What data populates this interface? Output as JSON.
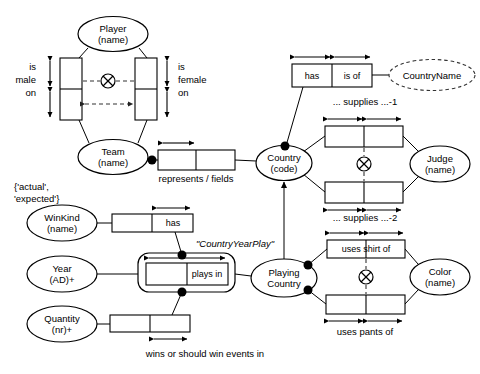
{
  "diagram": {
    "type": "orm-fact-diagram",
    "stroke_color": "#000000",
    "fill_color": "#ffffff",
    "dashed_color": "#555555"
  },
  "entities": [
    {
      "id": "player",
      "name": "Player",
      "ref": "(name)",
      "cx": 113,
      "cy": 34,
      "rx": 35,
      "ry": 17.5,
      "style": "solid"
    },
    {
      "id": "team",
      "name": "Team",
      "ref": "(name)",
      "cx": 113,
      "cy": 157,
      "rx": 35,
      "ry": 17.5,
      "style": "solid"
    },
    {
      "id": "countryname",
      "name": "CountryName",
      "ref": "",
      "cx": 432,
      "cy": 75,
      "rx": 43,
      "ry": 15.5,
      "style": "dashed"
    },
    {
      "id": "country",
      "name": "Country",
      "ref": "(code)",
      "cx": 284,
      "cy": 163,
      "rx": 28,
      "ry": 17.5,
      "style": "solid"
    },
    {
      "id": "judge",
      "name": "Judge",
      "ref": "(name)",
      "cx": 440,
      "cy": 164,
      "rx": 30,
      "ry": 18,
      "style": "solid"
    },
    {
      "id": "winkind",
      "name": "WinKind",
      "ref": "(name)",
      "cx": 62,
      "cy": 223,
      "rx": 35,
      "ry": 18,
      "style": "solid"
    },
    {
      "id": "year",
      "name": "Year",
      "ref": "(AD)+",
      "cx": 62,
      "cy": 274,
      "rx": 35,
      "ry": 18,
      "style": "solid"
    },
    {
      "id": "quantity",
      "name": "Quantity",
      "ref": "(nr)+",
      "cx": 62,
      "cy": 324,
      "rx": 35,
      "ry": 18,
      "style": "solid"
    },
    {
      "id": "playingcountry",
      "name": "Playing",
      "ref": "Country",
      "cx": 284,
      "cy": 278,
      "rx": 33,
      "ry": 19,
      "style": "solid"
    },
    {
      "id": "color",
      "name": "Color",
      "ref": "(name)",
      "cx": 440,
      "cy": 277,
      "rx": 30,
      "ry": 18,
      "style": "solid"
    }
  ],
  "fact_types": [
    {
      "id": "is-male-on",
      "orientation": "vertical",
      "x": 60,
      "y": 58,
      "w": 22,
      "h": 62,
      "cells": 2,
      "text": ""
    },
    {
      "id": "is-female-on",
      "orientation": "vertical",
      "x": 135,
      "y": 58,
      "w": 22,
      "h": 62,
      "cells": 2,
      "text": ""
    },
    {
      "id": "represents-fields",
      "orientation": "horizontal",
      "x": 158,
      "y": 150,
      "w": 77,
      "h": 20,
      "cells": 2,
      "text": ""
    },
    {
      "id": "has-is-of",
      "orientation": "horizontal",
      "x": 292,
      "y": 64,
      "w": 80,
      "h": 23,
      "cells": 2,
      "text": "has|is of"
    },
    {
      "id": "supplies-1",
      "orientation": "horizontal",
      "x": 325,
      "y": 126,
      "w": 78,
      "h": 21,
      "cells": 2,
      "text": ""
    },
    {
      "id": "supplies-2",
      "orientation": "horizontal",
      "x": 325,
      "y": 182,
      "w": 78,
      "h": 21,
      "cells": 2,
      "text": ""
    },
    {
      "id": "winkind-has",
      "orientation": "horizontal",
      "x": 112,
      "y": 214,
      "w": 81,
      "h": 18,
      "cells": 2,
      "text": "|has"
    },
    {
      "id": "plays-in-inner",
      "orientation": "horizontal",
      "x": 146,
      "y": 263,
      "w": 82,
      "h": 22,
      "cells": 2,
      "text": "|plays in"
    },
    {
      "id": "wins-events",
      "orientation": "horizontal",
      "x": 110,
      "y": 315,
      "w": 80,
      "h": 17,
      "cells": 2,
      "text": ""
    },
    {
      "id": "uses-shirt-of",
      "orientation": "horizontal",
      "x": 327,
      "y": 240,
      "w": 78,
      "h": 18,
      "cells": 2,
      "text": "uses shirt of"
    },
    {
      "id": "uses-pants-of",
      "orientation": "horizontal",
      "x": 326,
      "y": 295,
      "w": 79,
      "h": 19,
      "cells": 2,
      "text": ""
    }
  ],
  "objectified": [
    {
      "id": "country-year-play",
      "label": "\"CountryYearPlay\"",
      "x": 138,
      "y": 253,
      "w": 97,
      "h": 39
    }
  ],
  "labels": [
    {
      "id": "lbl-is-male-on",
      "text": "is\nmale\non",
      "x": 36,
      "y": 65,
      "align": "right",
      "italic": false
    },
    {
      "id": "lbl-is-female-on",
      "text": "is\nfemale\non",
      "x": 178,
      "y": 65,
      "align": "left",
      "italic": false
    },
    {
      "id": "lbl-represents",
      "text": "represents / fields",
      "x": 196,
      "y": 174,
      "align": "center",
      "italic": false
    },
    {
      "id": "lbl-supplies-1",
      "text": "... supplies ...-1",
      "x": 365,
      "y": 101,
      "align": "center",
      "italic": false
    },
    {
      "id": "lbl-supplies-2",
      "text": "... supplies ...-2",
      "x": 365,
      "y": 212,
      "align": "center",
      "italic": false
    },
    {
      "id": "lbl-value-constraint",
      "text": "{'actual',\n'expected'}",
      "x": 14,
      "y": 184,
      "align": "left",
      "italic": false
    },
    {
      "id": "lbl-countryyearplay",
      "text": "\"CountryYearPlay\"",
      "x": 196,
      "y": 243,
      "align": "left",
      "italic": true
    },
    {
      "id": "lbl-wins-events",
      "text": "wins or should win events in",
      "x": 205,
      "y": 350,
      "align": "center",
      "italic": false
    },
    {
      "id": "lbl-uses-pants-of",
      "text": "uses pants of",
      "x": 365,
      "y": 327,
      "align": "center",
      "italic": false
    }
  ],
  "role_texts": [
    {
      "id": "rt-has",
      "text": "has",
      "x": 312,
      "y": 76
    },
    {
      "id": "rt-is-of",
      "text": "is of",
      "x": 352,
      "y": 76
    },
    {
      "id": "rt-winkind-has",
      "text": "has",
      "x": 173,
      "y": 223
    },
    {
      "id": "rt-plays-in",
      "text": "plays in",
      "x": 207,
      "y": 274
    },
    {
      "id": "rt-uses-shirt-of",
      "text": "uses shirt of",
      "x": 366,
      "y": 249
    }
  ],
  "exclusion_constraints": [
    {
      "id": "xor-player-team",
      "cx": 108,
      "cy": 81,
      "r": 7
    },
    {
      "id": "xor-judge",
      "cx": 364,
      "cy": 164,
      "r": 7
    },
    {
      "id": "xor-color",
      "cx": 366,
      "cy": 277,
      "r": 7
    }
  ],
  "mandatory_dots": [
    {
      "id": "dot-team-represents",
      "x": 152,
      "y": 160
    },
    {
      "id": "dot-country-has",
      "x": 285,
      "y": 146
    },
    {
      "id": "dot-winkind-has",
      "x": 182,
      "y": 255
    },
    {
      "id": "dot-quantity-plays",
      "x": 182,
      "y": 292
    },
    {
      "id": "dot-pc-shirt",
      "x": 308,
      "y": 265
    },
    {
      "id": "dot-pc-pants",
      "x": 308,
      "y": 290
    }
  ],
  "uniqueness_bars": [
    {
      "id": "uq-is-male-on-a",
      "orientation": "vertical",
      "x": 50,
      "y": 58,
      "len": 31
    },
    {
      "id": "uq-is-male-on-b",
      "orientation": "vertical",
      "x": 50,
      "y": 89,
      "len": 31
    },
    {
      "id": "uq-is-female-on-a",
      "orientation": "vertical",
      "x": 167,
      "y": 58,
      "len": 31
    },
    {
      "id": "uq-is-female-on-b",
      "orientation": "vertical",
      "x": 167,
      "y": 89,
      "len": 31
    },
    {
      "id": "uq-represents",
      "orientation": "horizontal",
      "x": 160,
      "y": 143,
      "len": 36
    },
    {
      "id": "uq-has",
      "orientation": "horizontal",
      "x": 293,
      "y": 57,
      "len": 39
    },
    {
      "id": "uq-is-of",
      "orientation": "horizontal",
      "x": 333,
      "y": 57,
      "len": 39
    },
    {
      "id": "uq-sup1-a",
      "orientation": "horizontal",
      "x": 326,
      "y": 119,
      "len": 38
    },
    {
      "id": "uq-sup1-b",
      "orientation": "horizontal",
      "x": 365,
      "y": 119,
      "len": 38
    },
    {
      "id": "uq-sup2-a",
      "orientation": "horizontal",
      "x": 326,
      "y": 209,
      "len": 38
    },
    {
      "id": "uq-sup2-b",
      "orientation": "horizontal",
      "x": 365,
      "y": 209,
      "len": 38
    },
    {
      "id": "uq-winkind-has",
      "orientation": "horizontal",
      "x": 155,
      "y": 208,
      "len": 37
    },
    {
      "id": "uq-plays-in",
      "orientation": "horizontal",
      "x": 148,
      "y": 258,
      "len": 78
    },
    {
      "id": "uq-wins",
      "orientation": "horizontal",
      "x": 151,
      "y": 339,
      "len": 38
    },
    {
      "id": "uq-shirt-a",
      "orientation": "horizontal",
      "x": 328,
      "y": 233,
      "len": 38
    },
    {
      "id": "uq-shirt-b",
      "orientation": "horizontal",
      "x": 367,
      "y": 233,
      "len": 38
    },
    {
      "id": "uq-pants-a",
      "orientation": "horizontal",
      "x": 327,
      "y": 320,
      "len": 38
    },
    {
      "id": "uq-pants-b",
      "orientation": "horizontal",
      "x": 366,
      "y": 320,
      "len": 38
    }
  ],
  "mandatory_arrow": {
    "id": "arrow-country-playingcountry",
    "from_y": 259,
    "to_y": 182,
    "x": 284
  }
}
